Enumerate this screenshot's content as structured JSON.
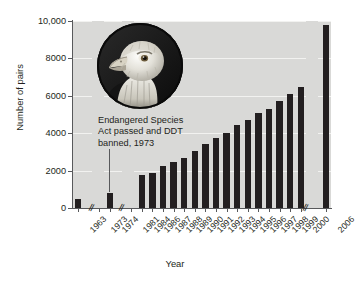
{
  "chart_data": {
    "type": "bar",
    "title": "",
    "subtitle": "",
    "xlabel": "Year",
    "ylabel": "Number of pairs",
    "ylim": [
      0,
      10000
    ],
    "yticks": [
      0,
      2000,
      4000,
      6000,
      8000,
      10000
    ],
    "ytick_labels": [
      "0",
      "2000",
      "4000",
      "6000",
      "8000",
      "10,000"
    ],
    "grid": "horizontal",
    "legend": "none",
    "axis_breaks": [
      "after 1963",
      "after 1974",
      "after 2000"
    ],
    "break_symbol": "//",
    "categories": [
      "1963",
      "1973",
      "1974",
      "1981",
      "1984",
      "1986",
      "1987",
      "1988",
      "1989",
      "1990",
      "1991",
      "1992",
      "1993",
      "1994",
      "1995",
      "1996",
      "1997",
      "1998",
      "1999",
      "2000",
      "2006"
    ],
    "values": [
      487,
      0,
      791,
      1188,
      1757,
      1875,
      2238,
      2475,
      2680,
      3035,
      3399,
      3749,
      4015,
      4449,
      4712,
      5094,
      5295,
      5748,
      6104,
      6471,
      9789
    ],
    "annotations": [
      {
        "text": "Endangered Species Act passed and DDT banned, 1973",
        "lines": [
          "Endangered Species",
          "Act passed and DDT",
          "banned, 1973"
        ],
        "points_to": "1973"
      }
    ],
    "inset_image": "bald-eagle-photo",
    "colors": {
      "bar": "#231f20",
      "plot_background": "#d9d9d7",
      "gridline": "#f2f2f0",
      "axis": "#58595b",
      "text": "#231f20",
      "page_background": "#ffffff"
    }
  },
  "axes": {
    "y_title": "Number of pairs",
    "x_title": "Year"
  }
}
